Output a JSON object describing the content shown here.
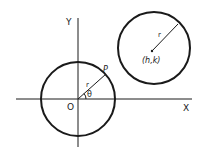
{
  "diagram": {
    "axes": {
      "x_label": "X",
      "y_label": "Y",
      "origin_label": "O"
    },
    "circle_origin": {
      "point_label": "P",
      "radius_label": "r",
      "angle_label": "θ"
    },
    "circle_shifted": {
      "center_label": "(h,k)",
      "radius_label": "r"
    },
    "colors": {
      "stroke": "#1a1a1a",
      "background": "#ffffff"
    }
  }
}
